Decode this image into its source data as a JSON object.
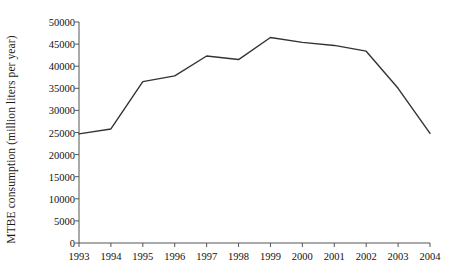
{
  "chart_data": {
    "type": "line",
    "title": "",
    "subtitle": "",
    "xlabel": "",
    "ylabel": "MTBE consumption (million liters per year)",
    "categories": [
      "1993",
      "1994",
      "1995",
      "1996",
      "1997",
      "1998",
      "1999",
      "2000",
      "2001",
      "2002",
      "2003",
      "2004"
    ],
    "x": [
      1993,
      1994,
      1995,
      1996,
      1997,
      1998,
      1999,
      2000,
      2001,
      2002,
      2003,
      2004
    ],
    "values": [
      24700,
      25800,
      36500,
      37800,
      42300,
      41500,
      46500,
      45400,
      44700,
      43400,
      35000,
      24800
    ],
    "series": [
      {
        "name": "MTBE consumption",
        "values": [
          24700,
          25800,
          36500,
          37800,
          42300,
          41500,
          46500,
          45400,
          44700,
          43400,
          35000,
          24800
        ]
      }
    ],
    "ylim": [
      0,
      50000
    ],
    "ytick_values": [
      0,
      5000,
      10000,
      15000,
      20000,
      25000,
      30000,
      35000,
      40000,
      45000,
      50000
    ],
    "ytick_labels": [
      "0",
      "5000",
      "10000",
      "15000",
      "20000",
      "25000",
      "30000",
      "35000",
      "40000",
      "45000",
      "50000"
    ],
    "xtick_labels": [
      "1993",
      "1994",
      "1995",
      "1996",
      "1997",
      "1998",
      "1999",
      "2000",
      "2001",
      "2002",
      "2003",
      "2004"
    ],
    "grid": false,
    "legend": false,
    "legend_position": "none",
    "line_color": "#333333",
    "axis_color": "#555555",
    "background_color": "#ffffff"
  }
}
